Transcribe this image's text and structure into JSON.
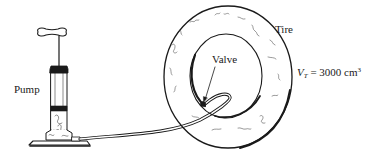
{
  "figure": {
    "labels": {
      "pump": "Pump",
      "tire": "Tire",
      "valve": "Valve"
    },
    "volume_annotation": {
      "symbol": "V",
      "subscript": "T",
      "equals": "=",
      "value": "3000",
      "unit": "cm",
      "unit_exponent": "3"
    }
  },
  "colors": {
    "ink": "#1a1a1a",
    "background": "#ffffff"
  }
}
